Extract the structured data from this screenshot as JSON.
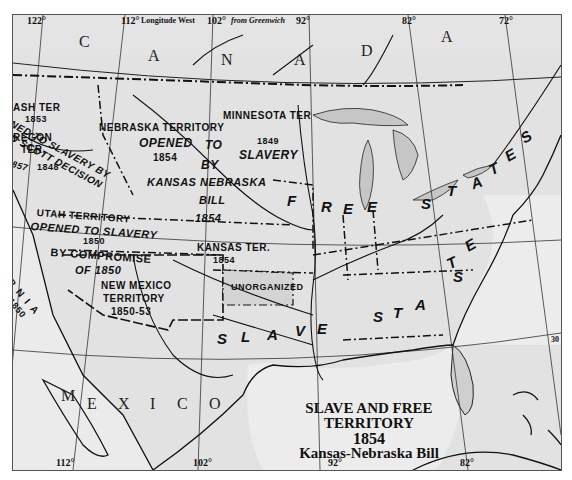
{
  "map": {
    "title": {
      "line1": "SLAVE AND FREE",
      "line2": "TERRITORY",
      "line3": "1854",
      "line4": "Kansas-Nebraska Bill"
    },
    "longitude_header": {
      "deg_122": "122°",
      "deg_112": "112°",
      "text": "Longitude West",
      "deg_102": "102°",
      "from": "from Greenwich",
      "deg_92": "92°",
      "deg_82": "82°",
      "deg_72": "72°"
    },
    "longitude_footer": {
      "deg_112": "112°",
      "deg_102": "102°",
      "deg_92": "92°",
      "deg_82": "82°"
    },
    "countries": {
      "canada": [
        "C",
        "A",
        "N",
        "A",
        "D",
        "A"
      ],
      "mexico": [
        "M",
        "E",
        "X",
        "I",
        "C",
        "O"
      ]
    },
    "regions": {
      "washington": {
        "name": "ASH TER",
        "year": "1853"
      },
      "oregon": {
        "name": "REGON",
        "suffix": "TER.",
        "year": "1848",
        "opened_1": "NED TO SLAVERY BY",
        "opened_2": "D SCOTT DECISION",
        "opened_year": "857"
      },
      "nebraska": {
        "name": "NEBRASKA TERRITORY",
        "opened": "OPENED",
        "year": "1854",
        "to": "TO",
        "by": "BY",
        "kansas_nebraska": "KANSAS NEBRASKA",
        "bill": "BILL",
        "bill_year": "1854"
      },
      "minnesota": {
        "name": "MINNESOTA TER",
        "year": "1849",
        "slavery": "SLAVERY"
      },
      "utah": {
        "name": "UTAH TERRITORY",
        "opened": "OPENED TO SLAVERY",
        "year": "1850",
        "by_compromise": "BY COMPROMISE",
        "of": "OF 1850"
      },
      "california": {
        "name": "RNIA",
        "year": "1850"
      },
      "kansas": {
        "name": "KANSAS TER.",
        "year": "1854"
      },
      "new_mexico": {
        "name1": "NEW MEXICO",
        "name2": "TERRITORY",
        "years": "1850-53"
      },
      "unorganized": {
        "name": "UNORGANIZED"
      },
      "free_states": [
        "F",
        "R",
        "E",
        "E",
        "S",
        "T",
        "A",
        "T",
        "E",
        "S"
      ],
      "slave_states": [
        "S",
        "L",
        "A",
        "V",
        "E",
        "S",
        "T",
        "A",
        "T",
        "E",
        "S"
      ]
    },
    "latitude_marks": {
      "right_mid": "30"
    },
    "colors": {
      "paper": "#e4e4e4",
      "land_shade": "#cfcfcf",
      "water": "#ededed",
      "line": "#111111"
    }
  }
}
